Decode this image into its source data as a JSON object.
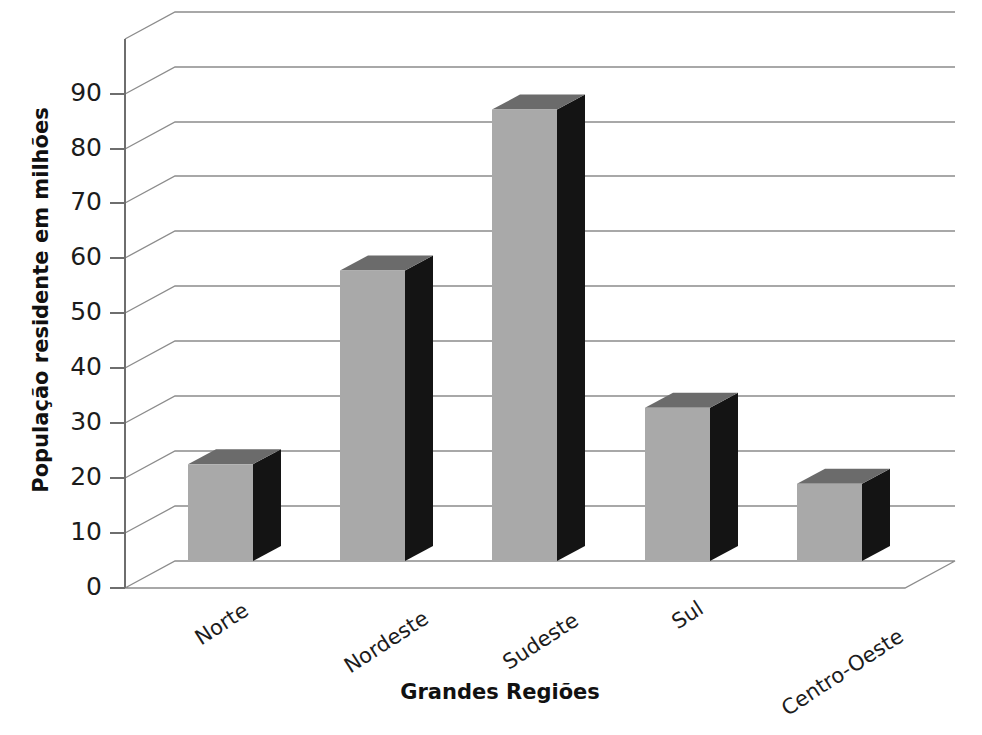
{
  "chart_data": {
    "type": "bar",
    "title": "",
    "subtitle": "",
    "xlabel": "Grandes Regiões",
    "ylabel": "População residente em milhões",
    "categories": [
      "Norte",
      "Nordeste",
      "Sudeste",
      "Sul",
      "Centro-Oeste"
    ],
    "values": [
      17.7,
      53.1,
      82.5,
      28.0,
      14.1
    ],
    "series": [
      {
        "name": "População residente",
        "values": [
          17.7,
          53.1,
          82.5,
          28.0,
          14.1
        ]
      }
    ],
    "ylim": [
      0,
      100
    ],
    "ytick_labels": [
      "0",
      "10",
      "20",
      "30",
      "40",
      "50",
      "60",
      "70",
      "80",
      "90"
    ],
    "ytick_values": [
      0,
      10,
      20,
      30,
      40,
      50,
      60,
      70,
      80,
      90
    ],
    "ytick_step": 10,
    "grid": true,
    "grid_axis": "y",
    "legend": false,
    "legend_position": "none",
    "style": "3d-column",
    "annotations": [],
    "colors": {
      "bar_front": "#a9a9a9",
      "bar_top": "#6b6b6b",
      "bar_side": "#141414",
      "gridline": "#8c8c8c",
      "axis": "#6e6e6e",
      "text": "#1c1c1c",
      "background": "#ffffff"
    }
  },
  "axes": {
    "y_axis_label": "População residente em milhões",
    "x_axis_label": "Grandes Regiões"
  }
}
